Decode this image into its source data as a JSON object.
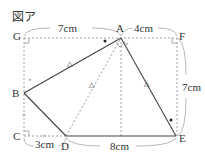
{
  "figure": {
    "title": "図ア",
    "points": {
      "A": "A",
      "B": "B",
      "C": "C",
      "D": "D",
      "E": "E",
      "F": "F",
      "G": "G"
    },
    "lengths": {
      "GA": "7cm",
      "AF": "4cm",
      "FE": "7cm",
      "CD": "3cm",
      "DE": "8cm"
    },
    "marks": {
      "triangle": "△",
      "cross": "×",
      "circle": "○",
      "dot": "●"
    }
  }
}
